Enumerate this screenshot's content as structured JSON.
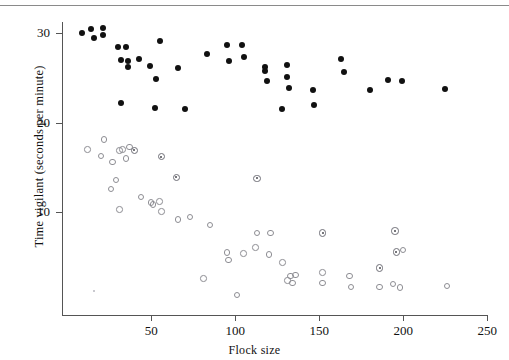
{
  "figure": {
    "top_rule": true,
    "background": "#ffffff"
  },
  "axes": {
    "x": {
      "label": "Flock size",
      "ticks": [
        50,
        100,
        150,
        200,
        250
      ],
      "tick_labels": [
        "50",
        "100",
        "150",
        "200",
        "250"
      ],
      "range": [
        0,
        253
      ]
    },
    "y": {
      "label": "Time vigilant (seconds per minute)",
      "ticks": [
        10,
        20,
        30
      ],
      "tick_labels": [
        "10",
        "20",
        "30"
      ],
      "range": [
        0,
        32.5
      ]
    }
  },
  "chart_data": {
    "type": "scatter",
    "title": "",
    "xlabel": "Flock size",
    "ylabel": "Time vigilant (seconds per minute)",
    "xlim": [
      0,
      253
    ],
    "ylim": [
      0,
      32.5
    ],
    "grid": false,
    "legend": "none",
    "series": [
      {
        "name": "filled-circles",
        "marker": "filled circle",
        "color": "#111111",
        "points": [
          [
            9,
            30.0
          ],
          [
            14,
            30.4
          ],
          [
            16,
            29.4
          ],
          [
            21,
            30.6
          ],
          [
            21,
            29.8
          ],
          [
            30,
            28.4
          ],
          [
            32,
            27.0
          ],
          [
            35,
            28.4
          ],
          [
            36,
            26.9
          ],
          [
            36,
            26.2
          ],
          [
            43,
            27.1
          ],
          [
            49,
            26.3
          ],
          [
            53,
            24.9
          ],
          [
            52,
            21.6
          ],
          [
            55,
            29.1
          ],
          [
            32,
            22.2
          ],
          [
            66,
            26.1
          ],
          [
            70,
            21.5
          ],
          [
            83,
            27.7
          ],
          [
            95,
            28.7
          ],
          [
            96,
            26.9
          ],
          [
            104,
            28.7
          ],
          [
            105,
            27.3
          ],
          [
            118,
            26.2
          ],
          [
            118,
            25.8
          ],
          [
            119,
            24.6
          ],
          [
            131,
            26.4
          ],
          [
            131,
            25.1
          ],
          [
            132,
            23.9
          ],
          [
            128,
            21.5
          ],
          [
            146,
            23.6
          ],
          [
            147,
            22.0
          ],
          [
            163,
            27.1
          ],
          [
            165,
            25.6
          ],
          [
            180,
            23.6
          ],
          [
            191,
            24.7
          ],
          [
            199,
            24.6
          ],
          [
            225,
            23.8
          ]
        ]
      },
      {
        "name": "open-circles",
        "marker": "open circle",
        "color": "#8d8d93",
        "points": [
          [
            12,
            17.0
          ],
          [
            20,
            16.3
          ],
          [
            27,
            15.6
          ],
          [
            22,
            18.1
          ],
          [
            29,
            13.6
          ],
          [
            31,
            16.9
          ],
          [
            33,
            17.0
          ],
          [
            35,
            16.0
          ],
          [
            37,
            17.3
          ],
          [
            26,
            12.6
          ],
          [
            31,
            10.3
          ],
          [
            44,
            11.7
          ],
          [
            50,
            11.1
          ],
          [
            51,
            10.9
          ],
          [
            55,
            11.2
          ],
          [
            56,
            10.1
          ],
          [
            66,
            9.2
          ],
          [
            73,
            9.5
          ],
          [
            85,
            8.6
          ],
          [
            81,
            2.6
          ],
          [
            95,
            5.5
          ],
          [
            96,
            4.7
          ],
          [
            105,
            5.4
          ],
          [
            101,
            0.8
          ],
          [
            112,
            6.1
          ],
          [
            113,
            7.7
          ],
          [
            121,
            7.7
          ],
          [
            120,
            5.3
          ],
          [
            128,
            4.4
          ],
          [
            133,
            2.9
          ],
          [
            131,
            2.4
          ],
          [
            136,
            3.0
          ],
          [
            134,
            2.1
          ],
          [
            152,
            3.3
          ],
          [
            152,
            2.1
          ],
          [
            168,
            2.9
          ],
          [
            169,
            1.7
          ],
          [
            186,
            1.7
          ],
          [
            194,
            2.0
          ],
          [
            198,
            1.6
          ],
          [
            200,
            5.8
          ],
          [
            226,
            1.8
          ]
        ]
      },
      {
        "name": "open-circles-with-center-dot",
        "marker": "dotted circle",
        "color": "#6f6f77",
        "points": [
          [
            40,
            16.9
          ],
          [
            56,
            16.2
          ],
          [
            65,
            13.9
          ],
          [
            113,
            13.8
          ],
          [
            152,
            7.7
          ],
          [
            195,
            7.9
          ],
          [
            196,
            5.6
          ],
          [
            186,
            3.8
          ]
        ]
      }
    ]
  }
}
